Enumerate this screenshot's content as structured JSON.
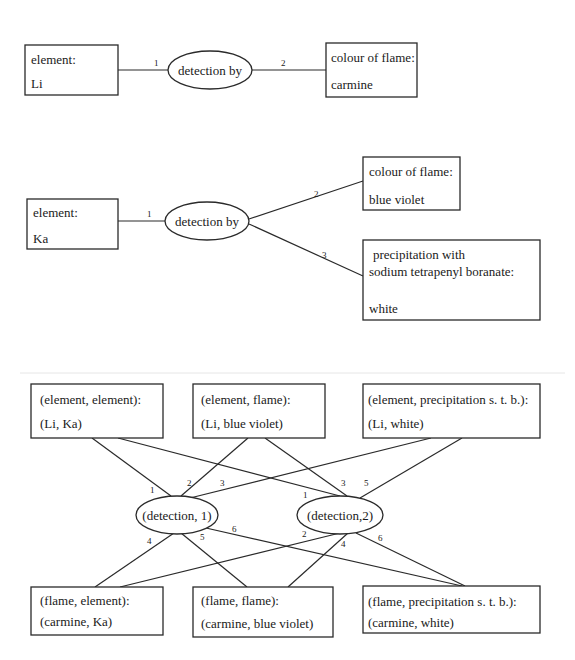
{
  "diagram1": {
    "element_box": {
      "label": "element:",
      "value": "Li"
    },
    "relation": "detection by",
    "flame_box": {
      "label": "colour of flame:",
      "value": "carmine"
    },
    "edge_labels": [
      "1",
      "2"
    ]
  },
  "diagram2": {
    "element_box": {
      "label": "element:",
      "value": "Ka"
    },
    "relation": "detection by",
    "flame_box": {
      "label": "colour of flame:",
      "value": "blue violet"
    },
    "precip_box": {
      "line1": "precipitation with",
      "line2": "sodium tetrapenyl boranate:",
      "value": "white"
    },
    "edge_labels": [
      "1",
      "2",
      "3"
    ]
  },
  "diagram3": {
    "top_boxes": [
      {
        "label": "(element, element):",
        "value": "(Li, Ka)"
      },
      {
        "label": "(element, flame):",
        "value": "(Li, blue violet)"
      },
      {
        "label": "(element, precipitation s. t. b.):",
        "value": "(Li, white)"
      }
    ],
    "relations": [
      "(detection, 1)",
      "(detection,2)"
    ],
    "bottom_boxes": [
      {
        "label": "(flame, element):",
        "value": "(carmine, Ka)"
      },
      {
        "label": "(flame, flame):",
        "value": "(carmine, blue violet)"
      },
      {
        "label": "(flame, precipitation s. t. b.):",
        "value": "(carmine, white)"
      }
    ],
    "edge_labels": {
      "d1": [
        "1",
        "2",
        "3",
        "4",
        "5",
        "6"
      ],
      "d2": [
        "1",
        "3",
        "5",
        "2",
        "4",
        "6"
      ]
    }
  }
}
